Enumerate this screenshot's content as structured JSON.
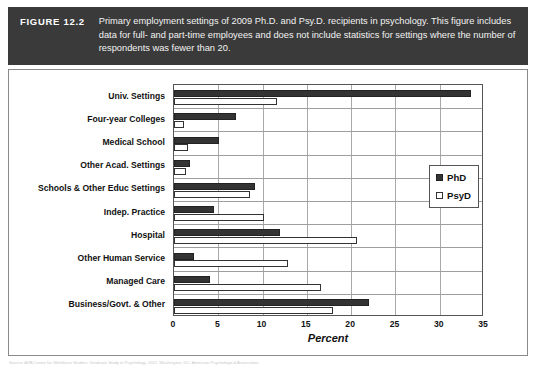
{
  "figure": {
    "label": "FIGURE 12.2",
    "caption": "Primary employment settings of 2009 Ph.D. and Psy.D. recipients in psychology. This figure includes data for full- and part-time employees and does not include statistics for settings where the number of respondents was fewer than 20.",
    "source_note": "Source: APA Center for Workforce Studies. Graduate Study in Psychology, 2011. Washington, DC: American Psychological Association."
  },
  "colors": {
    "banner_bg": "#3a3a3a",
    "banner_text": "#ffffff",
    "phd_fill": "#333333",
    "psyd_fill": "#ffffff",
    "series_outline": "#333333",
    "grid": "#a9a9a9",
    "frame": "#8a8a8a"
  },
  "chart_data": {
    "type": "bar",
    "orientation": "horizontal",
    "title": "",
    "subtitle": "",
    "xlabel": "Percent",
    "ylabel": "",
    "xlim": [
      0,
      35
    ],
    "xticks": [
      0,
      5,
      10,
      15,
      20,
      25,
      30,
      35
    ],
    "xtick_labels": [
      "0",
      "5",
      "10",
      "15",
      "20",
      "25",
      "30",
      "35"
    ],
    "grid": true,
    "grid_axis": "x",
    "legend_position": "right",
    "categories": [
      "Univ. Settings",
      "Four-year Colleges",
      "Medical School",
      "Other Acad. Settings",
      "Schools & Other Educ Settings",
      "Indep. Practice",
      "Hospital",
      "Other Human Service",
      "Managed Care",
      "Business/Govt. & Other"
    ],
    "series": [
      {
        "name": "PhD",
        "values": [
          33.5,
          7.0,
          5.1,
          1.8,
          9.2,
          4.5,
          12.0,
          2.3,
          4.1,
          22.0
        ]
      },
      {
        "name": "PsyD",
        "values": [
          11.6,
          1.1,
          1.6,
          1.4,
          8.6,
          10.2,
          20.7,
          12.9,
          16.6,
          17.9
        ]
      }
    ]
  }
}
